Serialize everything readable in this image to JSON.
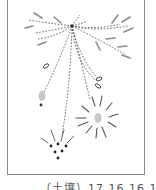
{
  "figure": {
    "caption": "（土壤）17 16 16 17",
    "colors": {
      "frame": "#8a8a8a",
      "dashed_line": "#555555",
      "stroke": "#8c8c8c",
      "blob": "#c8c8c8",
      "dot": "#333333"
    },
    "elements": [
      "central-node",
      "upper-left-rays",
      "upper-right-rays",
      "seed-pods",
      "gray-seed-left",
      "burst-right",
      "dot-cluster-bottom"
    ]
  }
}
